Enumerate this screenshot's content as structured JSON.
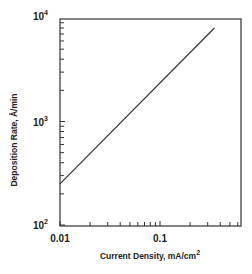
{
  "chart_data": {
    "type": "line",
    "title": "",
    "xlabel": "Current Density, mA/cm2",
    "xlabel_main": "Current Density, mA/cm",
    "xlabel_sup": "2",
    "ylabel": "Deposition Rate, Å/min",
    "xscale": "log",
    "yscale": "log",
    "xlim": [
      0.01,
      0.6
    ],
    "ylim": [
      100,
      10000
    ],
    "x_ticks": [
      {
        "value": 0.01,
        "label": "0.01"
      },
      {
        "value": 0.1,
        "label": "0.1"
      }
    ],
    "y_ticks": [
      {
        "value": 100,
        "base": "10",
        "exp": "2"
      },
      {
        "value": 1000,
        "base": "10",
        "exp": "3"
      },
      {
        "value": 10000,
        "base": "10",
        "exp": "4"
      }
    ],
    "grid": false,
    "legend": null,
    "series": [
      {
        "name": "Deposition Rate",
        "x": [
          0.01,
          0.35
        ],
        "y": [
          250,
          8000
        ]
      }
    ]
  }
}
